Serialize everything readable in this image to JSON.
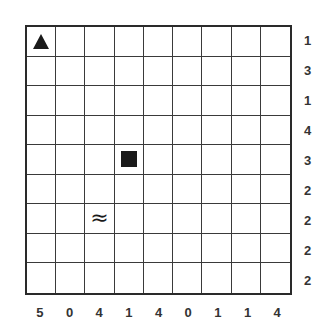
{
  "puzzle": {
    "rows": 9,
    "cols": 9,
    "row_clues": [
      "1",
      "3",
      "1",
      "4",
      "3",
      "2",
      "2",
      "2",
      "2"
    ],
    "col_clues": [
      "5",
      "0",
      "4",
      "1",
      "4",
      "0",
      "1",
      "1",
      "4"
    ],
    "markers": [
      {
        "row": 0,
        "col": 0,
        "type": "triangle",
        "icon": "triangle-icon"
      },
      {
        "row": 4,
        "col": 3,
        "type": "square",
        "icon": "square-icon"
      },
      {
        "row": 6,
        "col": 2,
        "type": "waves",
        "icon": "waves-icon",
        "glyph": "≈"
      }
    ],
    "colors": {
      "grid_line": "#3a3a3a",
      "border": "#2a2a2a",
      "marker": "#1a1a1a",
      "clue_text": "#333333",
      "background": "#ffffff"
    }
  }
}
